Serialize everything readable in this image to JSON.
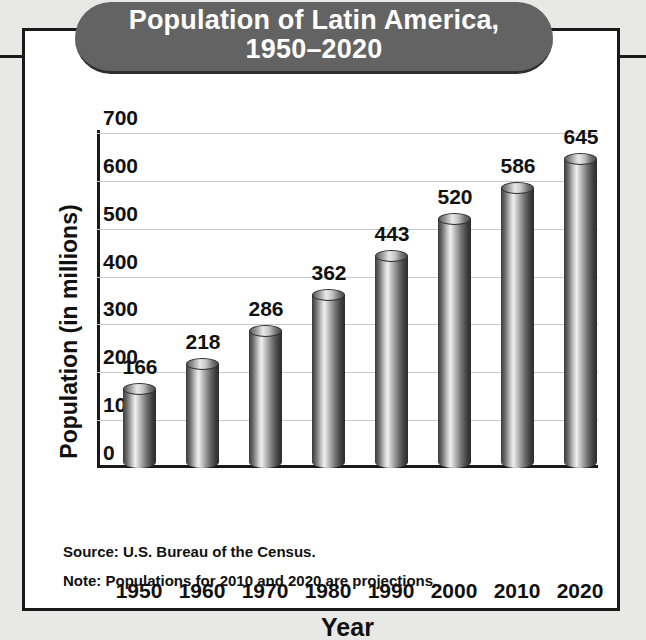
{
  "banner": {
    "title_line1": "Population of Latin America,",
    "title_line2": "1950–2020",
    "color": "#636363"
  },
  "notes": [
    "Source: U.S. Bureau of the Census.",
    "Note: Populations for 2010 and 2020 are projections."
  ],
  "chart_data": {
    "type": "bar",
    "title": "Population of Latin America, 1950–2020",
    "xlabel": "Year",
    "ylabel": "Population (in millions)",
    "categories": [
      "1950",
      "1960",
      "1970",
      "1980",
      "1990",
      "2000",
      "2010",
      "2020"
    ],
    "values": [
      166,
      218,
      286,
      362,
      443,
      520,
      586,
      645
    ],
    "yticks": [
      "0",
      "100",
      "200",
      "300",
      "400",
      "500",
      "600",
      "700"
    ],
    "ylim": [
      0,
      700
    ],
    "grid": true,
    "legend": "none",
    "bar_color": "#8a8a8a",
    "data_labels": [
      "166",
      "218",
      "286",
      "362",
      "443",
      "520",
      "586",
      "645"
    ]
  }
}
